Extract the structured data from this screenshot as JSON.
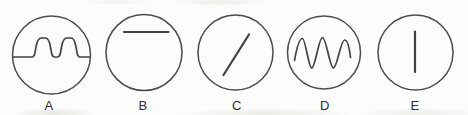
{
  "figure": {
    "options": [
      {
        "label": "A",
        "shape": "rounded-square-wave",
        "path": "M 13.5 57 H 32 C 35 57 35 52 36 47 C 37 41 38.5 38 41.5 38 H 45.5 C 48 38 49.5 41 50.5 47 C 51.5 52 51.5 57 54.5 57 H 57.5 C 60.5 57 60.5 52 61.5 47 C 62.5 41 64 38 67 38 H 71 C 73.5 38 75 41 76 47 C 77 52 77 57 80 57 H 90"
      },
      {
        "label": "B",
        "shape": "horizontal-line",
        "path": "M 124 32 H 168.5"
      },
      {
        "label": "C",
        "shape": "diagonal-line",
        "path": "M 223.5 75 L 249 34.5"
      },
      {
        "label": "D",
        "shape": "sine-wave",
        "path": "M 294.5 60.5 C 296.5 49 299 38.5 302.5 38.5 C 305.5 38.5 308.5 68 311.8 68 C 315.2 68 318.8 37.5 322.5 37.5 C 326.2 37.5 329.8 68 333.5 68 C 337 68 340.8 40 344.5 40 C 347.5 40 349.5 49 350.5 57.5"
      },
      {
        "label": "E",
        "shape": "vertical-line",
        "path": "M 415 31.5 V 72"
      }
    ],
    "colors": {
      "line_stroke": "#414141",
      "circle_stroke": "#4c4c4c",
      "label_text": "#2e2e2e",
      "background": "#fcfcfa"
    }
  }
}
